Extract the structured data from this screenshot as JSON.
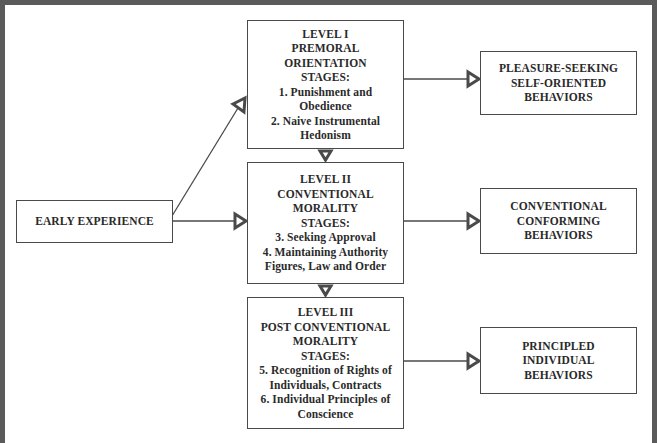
{
  "diagram": {
    "early_experience": {
      "label": "EARLY EXPERIENCE"
    },
    "levels": [
      {
        "heading": [
          "LEVEL I",
          "PREMORAL",
          "ORIENTATION",
          "STAGES:"
        ],
        "stages": [
          "1. Punishment and",
          "Obedience",
          "2. Naive Instrumental",
          "Hedonism"
        ],
        "outcome": [
          "PLEASURE-SEEKING",
          "SELF-ORIENTED",
          "BEHAVIORS"
        ]
      },
      {
        "heading": [
          "LEVEL II",
          "CONVENTIONAL",
          "MORALITY",
          "STAGES:"
        ],
        "stages": [
          "3. Seeking Approval",
          "4. Maintaining Authority",
          "Figures, Law and Order"
        ],
        "outcome": [
          "CONVENTIONAL",
          "CONFORMING",
          "BEHAVIORS"
        ]
      },
      {
        "heading": [
          "LEVEL III",
          "POST CONVENTIONAL",
          "MORALITY",
          "STAGES:"
        ],
        "stages": [
          "5. Recognition of Rights of",
          "Individuals, Contracts",
          "6. Individual Principles of",
          "Conscience"
        ],
        "outcome": [
          "PRINCIPLED",
          "INDIVIDUAL",
          "BEHAVIORS"
        ]
      }
    ],
    "connections": [
      {
        "from": "early_experience",
        "to": "level_1",
        "style": "open-triangle-arrow"
      },
      {
        "from": "early_experience",
        "to": "level_2",
        "style": "open-triangle-arrow"
      },
      {
        "from": "level_1",
        "to": "level_2",
        "style": "open-triangle-arrow"
      },
      {
        "from": "level_2",
        "to": "level_3",
        "style": "open-triangle-arrow"
      },
      {
        "from": "level_1",
        "to": "outcome_1",
        "style": "open-triangle-arrow"
      },
      {
        "from": "level_2",
        "to": "outcome_2",
        "style": "open-triangle-arrow"
      },
      {
        "from": "level_3",
        "to": "outcome_3",
        "style": "open-triangle-arrow"
      }
    ],
    "colors": {
      "ink": "#4a4a4a",
      "frame": "#5a5a5a",
      "background": "#ffffff"
    }
  }
}
